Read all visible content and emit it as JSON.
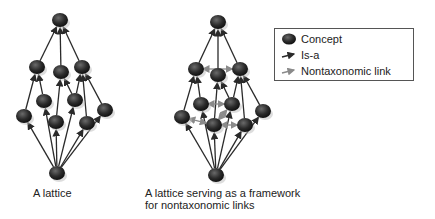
{
  "colors": {
    "node": "#2b2b2b",
    "isa_edge": "#2a2a2a",
    "nontax_edge": "#8a8a8a",
    "text": "#222222"
  },
  "left_lattice": {
    "caption": "A lattice",
    "nodes": [
      {
        "id": "top",
        "x": 60,
        "y": 20
      },
      {
        "id": "a",
        "x": 37,
        "y": 67
      },
      {
        "id": "b",
        "x": 61,
        "y": 72
      },
      {
        "id": "c",
        "x": 82,
        "y": 67
      },
      {
        "id": "d",
        "x": 44,
        "y": 101
      },
      {
        "id": "e",
        "x": 75,
        "y": 100
      },
      {
        "id": "f",
        "x": 24,
        "y": 116
      },
      {
        "id": "g",
        "x": 56,
        "y": 122
      },
      {
        "id": "h",
        "x": 87,
        "y": 123
      },
      {
        "id": "i",
        "x": 105,
        "y": 110
      },
      {
        "id": "bottom",
        "x": 57,
        "y": 173
      }
    ],
    "isa_edges": [
      [
        "a",
        "top"
      ],
      [
        "b",
        "top"
      ],
      [
        "c",
        "top"
      ],
      [
        "f",
        "a"
      ],
      [
        "d",
        "a"
      ],
      [
        "g",
        "b"
      ],
      [
        "e",
        "b"
      ],
      [
        "e",
        "c"
      ],
      [
        "h",
        "c"
      ],
      [
        "i",
        "c"
      ],
      [
        "bottom",
        "f"
      ],
      [
        "bottom",
        "d"
      ],
      [
        "bottom",
        "g"
      ],
      [
        "bottom",
        "e"
      ],
      [
        "bottom",
        "h"
      ],
      [
        "bottom",
        "i"
      ]
    ],
    "nontax_edges": []
  },
  "right_lattice": {
    "caption_line1": "A lattice serving as a framework",
    "caption_line2": "for nontaxonomic links",
    "nodes": [
      {
        "id": "top",
        "x": 218,
        "y": 22
      },
      {
        "id": "a",
        "x": 196,
        "y": 69
      },
      {
        "id": "b",
        "x": 218,
        "y": 75
      },
      {
        "id": "c",
        "x": 240,
        "y": 69
      },
      {
        "id": "d",
        "x": 201,
        "y": 104
      },
      {
        "id": "e",
        "x": 232,
        "y": 104
      },
      {
        "id": "f",
        "x": 182,
        "y": 117
      },
      {
        "id": "g",
        "x": 214,
        "y": 125
      },
      {
        "id": "h",
        "x": 245,
        "y": 125
      },
      {
        "id": "i",
        "x": 263,
        "y": 111
      },
      {
        "id": "bottom",
        "x": 216,
        "y": 175
      }
    ],
    "isa_edges": [
      [
        "a",
        "top"
      ],
      [
        "b",
        "top"
      ],
      [
        "c",
        "top"
      ],
      [
        "f",
        "a"
      ],
      [
        "d",
        "a"
      ],
      [
        "g",
        "b"
      ],
      [
        "e",
        "b"
      ],
      [
        "e",
        "c"
      ],
      [
        "h",
        "c"
      ],
      [
        "i",
        "c"
      ],
      [
        "bottom",
        "f"
      ],
      [
        "bottom",
        "d"
      ],
      [
        "bottom",
        "g"
      ],
      [
        "bottom",
        "e"
      ],
      [
        "bottom",
        "h"
      ],
      [
        "bottom",
        "i"
      ]
    ],
    "nontax_edges": [
      [
        "a",
        "c"
      ],
      [
        "d",
        "e"
      ],
      [
        "g",
        "e"
      ],
      [
        "g",
        "h"
      ],
      [
        "f",
        "g"
      ]
    ]
  },
  "legend": {
    "items": [
      {
        "icon": "concept-node-icon",
        "label": "Concept"
      },
      {
        "icon": "is-a-arrow-icon",
        "label": "Is-a"
      },
      {
        "icon": "nontaxonomic-arrow-icon",
        "label": "Nontaxonomic link"
      }
    ]
  }
}
